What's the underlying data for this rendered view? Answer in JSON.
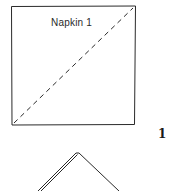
{
  "diagram": {
    "napkin_label": "Napkin 1",
    "step_number": "1",
    "line_color": "#2a2a2a",
    "square": {
      "x1": 11,
      "y1": 6,
      "x2": 135,
      "y2": 125
    },
    "fold_line": {
      "style": "dashed",
      "from": [
        14,
        123
      ],
      "to": [
        133,
        8
      ]
    },
    "folded_triangle": {
      "apex": [
        78,
        153
      ],
      "left_base": [
        38,
        191
      ],
      "right_base": [
        119,
        191
      ]
    }
  }
}
